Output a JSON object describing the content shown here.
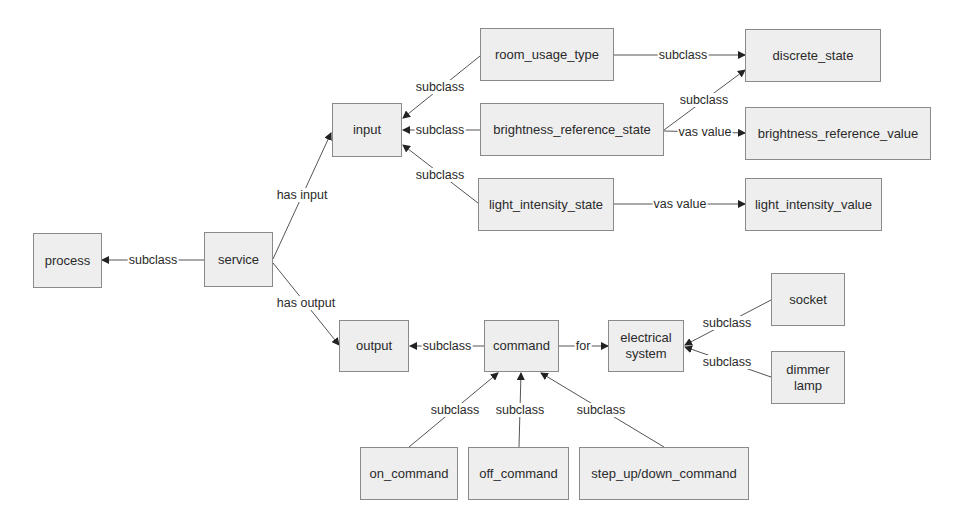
{
  "diagram": {
    "nodes": {
      "process": {
        "label": "process"
      },
      "service": {
        "label": "service"
      },
      "input": {
        "label": "input"
      },
      "output": {
        "label": "output"
      },
      "room_usage_type": {
        "label": "room_usage_type"
      },
      "brightness_reference_state": {
        "label": "brightness_reference_state"
      },
      "light_intensity_state": {
        "label": "light_intensity_state"
      },
      "discrete_state": {
        "label": "discrete_state"
      },
      "brightness_reference_value": {
        "label": "brightness_reference_value"
      },
      "light_intensity_value": {
        "label": "light_intensity_value"
      },
      "command": {
        "label": "command"
      },
      "electrical_system": {
        "label": "electrical system"
      },
      "socket": {
        "label": "socket"
      },
      "dimmer_lamp": {
        "label": "dimmer lamp"
      },
      "on_command": {
        "label": "on_command"
      },
      "off_command": {
        "label": "off_command"
      },
      "step_command": {
        "label": "step_up/down_command"
      }
    },
    "edges": [
      {
        "from": "service",
        "to": "process",
        "label": "subclass"
      },
      {
        "from": "service",
        "to": "input",
        "label": "has input"
      },
      {
        "from": "service",
        "to": "output",
        "label": "has output"
      },
      {
        "from": "room_usage_type",
        "to": "input",
        "label": "subclass"
      },
      {
        "from": "brightness_reference_state",
        "to": "input",
        "label": "subclass"
      },
      {
        "from": "light_intensity_state",
        "to": "input",
        "label": "subclass"
      },
      {
        "from": "room_usage_type",
        "to": "discrete_state",
        "label": "subclass"
      },
      {
        "from": "brightness_reference_state",
        "to": "discrete_state",
        "label": "subclass"
      },
      {
        "from": "brightness_reference_state",
        "to": "brightness_reference_value",
        "label": "vas value"
      },
      {
        "from": "light_intensity_state",
        "to": "light_intensity_value",
        "label": "vas value"
      },
      {
        "from": "command",
        "to": "output",
        "label": "subclass"
      },
      {
        "from": "command",
        "to": "electrical_system",
        "label": "for"
      },
      {
        "from": "socket",
        "to": "electrical_system",
        "label": "subclass"
      },
      {
        "from": "dimmer_lamp",
        "to": "electrical_system",
        "label": "subclass"
      },
      {
        "from": "on_command",
        "to": "command",
        "label": "subclass"
      },
      {
        "from": "off_command",
        "to": "command",
        "label": "subclass"
      },
      {
        "from": "step_command",
        "to": "command",
        "label": "subclass"
      }
    ]
  }
}
